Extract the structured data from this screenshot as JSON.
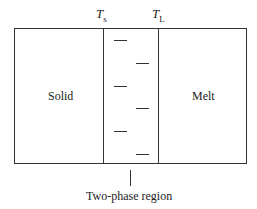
{
  "diagram": {
    "temperatures": [
      {
        "symbol": "T",
        "subscript": "s"
      },
      {
        "symbol": "T",
        "subscript": "L"
      }
    ],
    "regions": {
      "left": "Solid",
      "middle": "Two-phase region",
      "right": "Melt"
    },
    "dashes": {
      "left_column_y": [
        40,
        86,
        131
      ],
      "right_column_y": [
        63,
        108,
        154
      ]
    }
  }
}
